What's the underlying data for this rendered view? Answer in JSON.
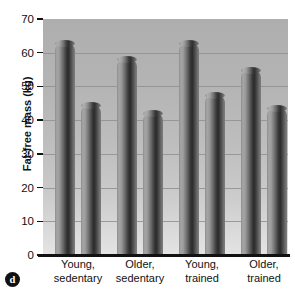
{
  "panel": {
    "letter": "d"
  },
  "chart_data": {
    "type": "bar",
    "title": "",
    "subtitle": "",
    "xlabel": "",
    "ylabel": "Fat-free mass (kg)",
    "ylim": [
      0,
      70
    ],
    "ytick_labels": [
      "0",
      "10",
      "20",
      "30",
      "40",
      "50",
      "60",
      "70"
    ],
    "ytick_values": [
      0,
      10,
      20,
      30,
      40,
      50,
      60,
      70
    ],
    "grid": true,
    "grid_axis": "y",
    "legend": false,
    "legend_position": "none",
    "categories": [
      "Young, sedentary",
      "Older, sedentary",
      "Young, trained",
      "Older, trained"
    ],
    "category_lines": [
      [
        "Young,",
        "sedentary"
      ],
      [
        "Older,",
        "sedentary"
      ],
      [
        "Young,",
        "trained"
      ],
      [
        "Older,",
        "trained"
      ]
    ],
    "series": [
      {
        "name": "Men",
        "values": [
          63.0,
          58.0,
          63.0,
          55.0
        ]
      },
      {
        "name": "Women",
        "values": [
          44.5,
          42.0,
          47.5,
          43.5
        ]
      }
    ],
    "bars": [
      {
        "group": "Young, sedentary",
        "series": "Men",
        "value": 63.0
      },
      {
        "group": "Young, sedentary",
        "series": "Women",
        "value": 44.5
      },
      {
        "group": "Older, sedentary",
        "series": "Men",
        "value": 58.0
      },
      {
        "group": "Older, sedentary",
        "series": "Women",
        "value": 42.0
      },
      {
        "group": "Young, trained",
        "series": "Men",
        "value": 63.0
      },
      {
        "group": "Young, trained",
        "series": "Women",
        "value": 47.5
      },
      {
        "group": "Older, trained",
        "series": "Men",
        "value": 55.0
      },
      {
        "group": "Older, trained",
        "series": "Women",
        "value": 43.5
      }
    ],
    "colors": {
      "bar_dark": "#2a2a2a",
      "bar_light": "#a6a6a6",
      "plot_bg_top": "#aeaeae",
      "plot_bg_bottom": "#e4e4e4",
      "gridline": "#8f8f8f",
      "axis": "#111111",
      "text": "#111111"
    }
  }
}
